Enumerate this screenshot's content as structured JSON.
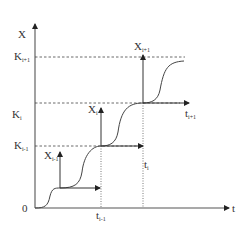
{
  "diagram": {
    "type": "staircase-s-curve",
    "axes": {
      "y_label": "X",
      "x_label": "t",
      "origin_label": "0"
    },
    "y_levels": [
      {
        "label": "K",
        "sub": "i+1",
        "name": "K_i+1"
      },
      {
        "label": "K",
        "sub": "i",
        "name": "K_i"
      },
      {
        "label": "K",
        "sub": "i-1",
        "name": "K_i-1"
      }
    ],
    "local_axes": [
      {
        "y_label": "X",
        "y_sub": "i-1",
        "x_label": "t",
        "x_sub": "i-1"
      },
      {
        "y_label": "X",
        "y_sub": "i",
        "x_label": "t",
        "x_sub": "i"
      },
      {
        "y_label": "X",
        "y_sub": "i+1",
        "x_label": "t",
        "x_sub": "i+1"
      }
    ]
  }
}
